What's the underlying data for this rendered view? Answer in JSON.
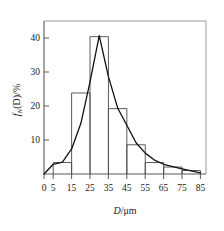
{
  "chart_data": {
    "type": "bar",
    "title": "",
    "subtitle": "",
    "xlabel": "D/μm",
    "xlabel_symbol": "D",
    "xlabel_unit": "/μm",
    "ylabel": "f_N(D)/%",
    "ylabel_symbol": "f",
    "ylabel_subscript": "N",
    "ylabel_rest": "(D)/%",
    "xlim": [
      0,
      88
    ],
    "ylim": [
      0,
      44
    ],
    "grid": false,
    "legend": false,
    "legend_position": "none",
    "x_tick_labels": [
      "0",
      "5",
      "15",
      "25",
      "35",
      "45",
      "55",
      "65",
      "75",
      "85"
    ],
    "x_tick_values": [
      0,
      5,
      15,
      25,
      35,
      45,
      55,
      65,
      75,
      85
    ],
    "y_tick_labels": [
      "10",
      "20",
      "30",
      "40"
    ],
    "y_tick_values": [
      10,
      20,
      30,
      40
    ],
    "bin_edges": [
      5,
      15,
      25,
      35,
      45,
      55,
      65,
      75,
      85
    ],
    "bin_centers": [
      10,
      20,
      30,
      40,
      50,
      60,
      70,
      80
    ],
    "categories": [
      "5-15",
      "15-25",
      "25-35",
      "35-45",
      "45-55",
      "55-65",
      "65-75",
      "75-85"
    ],
    "values": [
      3.3,
      23.3,
      39.5,
      18.8,
      8.4,
      3.3,
      2.0,
      1.0
    ],
    "series": [
      {
        "name": "histogram",
        "type": "bar",
        "values": [
          3.3,
          23.3,
          39.5,
          18.8,
          8.4,
          3.3,
          2.0,
          1.0
        ]
      },
      {
        "name": "fitted-curve",
        "type": "line",
        "x": [
          0,
          5,
          10,
          15,
          20,
          25,
          30,
          35,
          40,
          45,
          50,
          55,
          60,
          65,
          70,
          75,
          80,
          85
        ],
        "y": [
          0.0,
          2.8,
          3.4,
          7.2,
          14.5,
          26.5,
          39.8,
          28.0,
          19.0,
          14.0,
          9.0,
          6.0,
          4.0,
          2.8,
          2.1,
          1.5,
          0.9,
          0.3
        ]
      }
    ],
    "annotations": []
  },
  "figure": {
    "background_color": "#ffffff",
    "axis_color": "#5a5a5a",
    "frame_color": "#9a9a9a",
    "bar_stroke_color": "#4a4a4a",
    "curve_color": "#111111",
    "text_color": "#1a1a1a"
  }
}
